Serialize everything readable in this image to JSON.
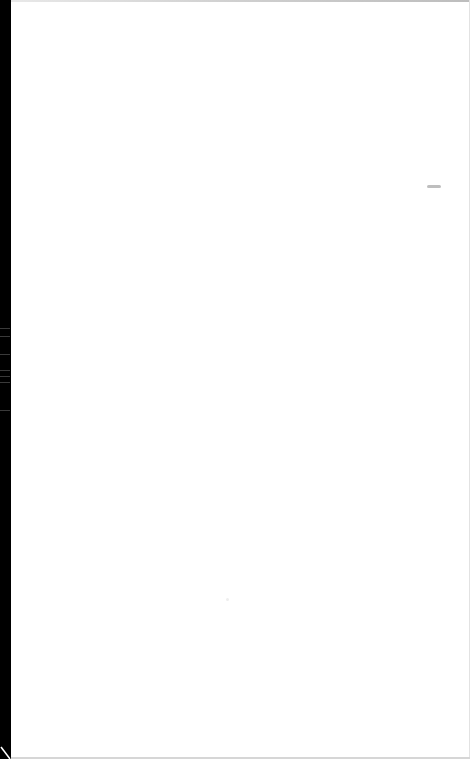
{
  "page": {
    "background_color": "#ffffff",
    "edge_color": "#000000",
    "text_content": []
  },
  "marks": {
    "smudge": {
      "icon": "gray-smudge-mark",
      "color": "#a8a8a8"
    },
    "corner": {
      "icon": "page-curl-corner"
    }
  }
}
